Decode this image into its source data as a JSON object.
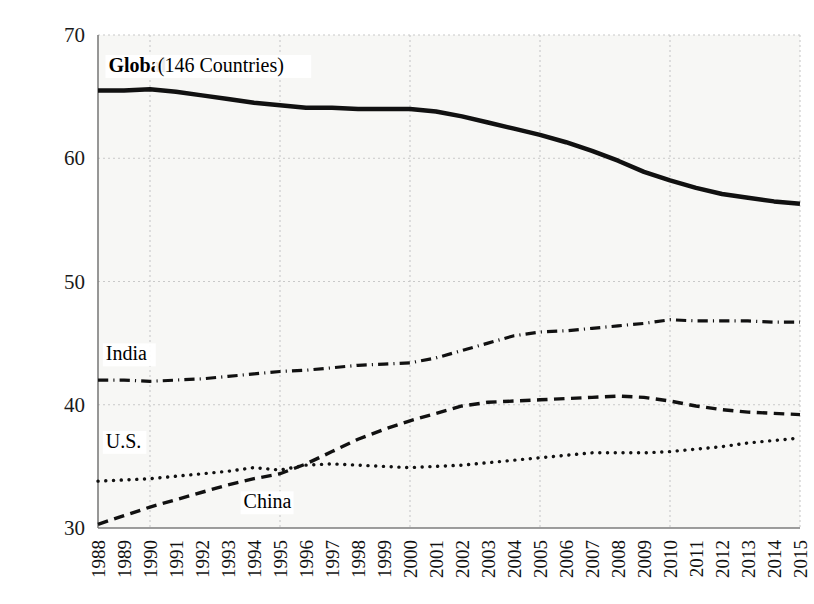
{
  "figure": {
    "caption_fragment": "",
    "background": "#f7f7f5",
    "axis_color": "#7d7d7d",
    "grid_color": "#c9c9c9",
    "line_color": "#111111"
  },
  "chart_data": {
    "type": "line",
    "title": "",
    "xlabel": "",
    "ylabel": "",
    "xlim": [
      1988,
      2015
    ],
    "ylim": [
      30,
      70
    ],
    "grid": true,
    "grid_style": "dotted",
    "legend": "inline-annotations",
    "x": [
      1988,
      1989,
      1990,
      1991,
      1992,
      1993,
      1994,
      1995,
      1996,
      1997,
      1998,
      1999,
      2000,
      2001,
      2002,
      2003,
      2004,
      2005,
      2006,
      2007,
      2008,
      2009,
      2010,
      2011,
      2012,
      2013,
      2014,
      2015
    ],
    "categories": [
      "1988",
      "1989",
      "1990",
      "1991",
      "1992",
      "1993",
      "1994",
      "1995",
      "1996",
      "1997",
      "1998",
      "1999",
      "2000",
      "2001",
      "2002",
      "2003",
      "2004",
      "2005",
      "2006",
      "2007",
      "2008",
      "2009",
      "2010",
      "2011",
      "2012",
      "2013",
      "2014",
      "2015"
    ],
    "yticks": [
      30,
      40,
      50,
      60,
      70
    ],
    "ytick_labels": [
      "30",
      "40",
      "50",
      "60",
      "70"
    ],
    "series": [
      {
        "name": "Global (146 Countries)",
        "label": "Global",
        "label_suffix": " (146 Countries)",
        "style": "solid",
        "width": 4.5,
        "values": [
          65.5,
          65.5,
          65.6,
          65.4,
          65.1,
          64.8,
          64.5,
          64.3,
          64.1,
          64.1,
          64.0,
          64.0,
          64.0,
          63.8,
          63.4,
          62.9,
          62.4,
          61.9,
          61.3,
          60.6,
          59.8,
          58.9,
          58.2,
          57.6,
          57.1,
          56.8,
          56.5,
          56.3
        ]
      },
      {
        "name": "India",
        "label": "India",
        "style": "dashdot",
        "width": 3.2,
        "values": [
          42.0,
          42.0,
          41.9,
          42.0,
          42.1,
          42.3,
          42.5,
          42.7,
          42.8,
          43.0,
          43.2,
          43.3,
          43.4,
          43.8,
          44.4,
          45.0,
          45.6,
          45.9,
          46.0,
          46.2,
          46.4,
          46.6,
          46.9,
          46.8,
          46.8,
          46.8,
          46.7,
          46.7
        ]
      },
      {
        "name": "China",
        "label": "China",
        "style": "dashed",
        "width": 3.4,
        "values": [
          30.3,
          31.0,
          31.7,
          32.3,
          32.9,
          33.5,
          34.0,
          34.4,
          35.2,
          36.2,
          37.2,
          38.0,
          38.7,
          39.3,
          39.9,
          40.2,
          40.3,
          40.4,
          40.5,
          40.6,
          40.7,
          40.6,
          40.3,
          39.9,
          39.6,
          39.4,
          39.3,
          39.2
        ]
      },
      {
        "name": "U.S.",
        "label": "U.S.",
        "style": "dotted",
        "width": 3.4,
        "values": [
          33.8,
          33.9,
          34.0,
          34.2,
          34.4,
          34.6,
          34.9,
          34.7,
          35.1,
          35.2,
          35.1,
          35.0,
          34.9,
          35.0,
          35.1,
          35.3,
          35.5,
          35.7,
          35.9,
          36.1,
          36.1,
          36.1,
          36.2,
          36.4,
          36.6,
          36.9,
          37.1,
          37.3
        ]
      }
    ],
    "annotations": [
      {
        "text": "Global",
        "bold": true,
        "x": 1988.4,
        "y": 67.0
      },
      {
        "text": " (146 Countries)",
        "bold": false,
        "x": 1990.3,
        "y": 67.0
      },
      {
        "text": "India",
        "bold": false,
        "x": 1988.3,
        "y": 43.6
      },
      {
        "text": "U.S.",
        "bold": false,
        "x": 1988.3,
        "y": 36.5
      },
      {
        "text": "China",
        "bold": false,
        "x": 1993.6,
        "y": 31.6
      }
    ]
  }
}
